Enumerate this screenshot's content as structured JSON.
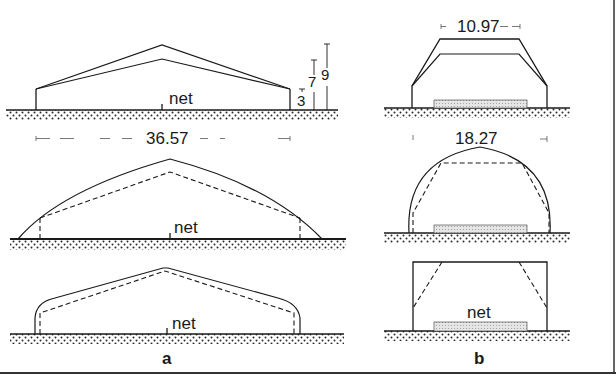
{
  "figure": {
    "panel_a_label": "a",
    "panel_b_label": "b",
    "colors": {
      "ink": "#1a1a1a",
      "ground": "#2a2a2a",
      "net": "#bdbdbd",
      "background": "#ffffff"
    }
  },
  "panel_a": {
    "diagram_1": {
      "net_label": "net",
      "height_labels": [
        "3",
        "7",
        "9"
      ],
      "span_label": "36.57"
    },
    "diagram_2": {
      "net_label": "net"
    },
    "diagram_3": {
      "net_label": "net"
    }
  },
  "panel_b": {
    "diagram_1": {
      "width_label": "10.97"
    },
    "diagram_2": {
      "width_label": "18.27"
    },
    "diagram_3": {
      "net_label": "net"
    }
  }
}
